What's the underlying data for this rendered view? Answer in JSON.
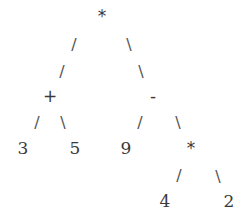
{
  "diagram": {
    "type": "expression-tree",
    "expression": "(3 + 5) * (9 - (4 * 2))",
    "nodes": [
      {
        "id": "root",
        "label": "*",
        "x": 102,
        "y": 16,
        "kind": "op"
      },
      {
        "id": "plus",
        "label": "+",
        "x": 50,
        "y": 96,
        "kind": "op"
      },
      {
        "id": "minus",
        "label": "-",
        "x": 153,
        "y": 96,
        "kind": "op"
      },
      {
        "id": "n3",
        "label": "3",
        "x": 23,
        "y": 148,
        "kind": "num"
      },
      {
        "id": "n5",
        "label": "5",
        "x": 75,
        "y": 148,
        "kind": "num"
      },
      {
        "id": "n9",
        "label": "9",
        "x": 126,
        "y": 148,
        "kind": "num"
      },
      {
        "id": "times2",
        "label": "*",
        "x": 191,
        "y": 148,
        "kind": "op"
      },
      {
        "id": "n4",
        "label": "4",
        "x": 165,
        "y": 201,
        "kind": "num"
      },
      {
        "id": "n2",
        "label": "2",
        "x": 229,
        "y": 201,
        "kind": "num"
      }
    ],
    "edges": [
      {
        "label": "/",
        "x": 74,
        "y": 45
      },
      {
        "label": "/",
        "x": 62,
        "y": 72
      },
      {
        "label": "\\",
        "x": 129,
        "y": 45
      },
      {
        "label": "\\",
        "x": 141,
        "y": 72
      },
      {
        "label": "/",
        "x": 37,
        "y": 123
      },
      {
        "label": "\\",
        "x": 63,
        "y": 123
      },
      {
        "label": "/",
        "x": 140,
        "y": 123
      },
      {
        "label": "\\",
        "x": 178,
        "y": 123
      },
      {
        "label": "/",
        "x": 179,
        "y": 176
      },
      {
        "label": "\\",
        "x": 218,
        "y": 177
      }
    ]
  }
}
